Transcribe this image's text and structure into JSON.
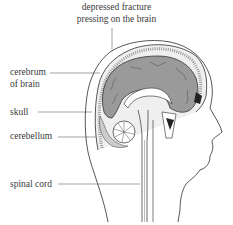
{
  "diagram": {
    "labels": {
      "fracture_line1": "depressed fracture",
      "fracture_line2": "pressing on the brain",
      "cerebrum_line1": "cerebrum",
      "cerebrum_line2": "of brain",
      "skull": "skull",
      "cerebellum": "cerebellum",
      "spinal_cord": "spinal cord"
    },
    "colors": {
      "brain_fill": "#9a9a9a",
      "outline": "#444444",
      "dark_cavity": "#222222",
      "label_text": "#3a3a3a"
    }
  }
}
